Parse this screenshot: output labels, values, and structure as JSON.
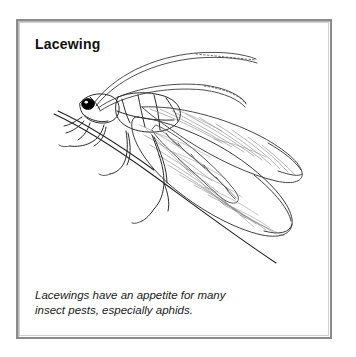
{
  "card": {
    "title": "Lacewing",
    "border_color": "#8b8b8b",
    "background_color": "#ffffff"
  },
  "illustration": {
    "subject": "lacewing-insect",
    "alt": "Side view line drawing of a lacewing insect perched on a thin twig, with two long curving antennae and large veined transparent wings",
    "ink_color": "#2b2b2b",
    "vein_color": "#6f6f6f",
    "eye_color": "#000000",
    "parts": [
      "antenna-upper",
      "antenna-lower",
      "head",
      "eye",
      "thorax",
      "abdomen",
      "forewing",
      "hindwing",
      "wing-venation",
      "legs",
      "twig"
    ]
  },
  "caption": {
    "line1": "Lacewings have an appetite for many",
    "line2": "insect pests, especially aphids."
  }
}
